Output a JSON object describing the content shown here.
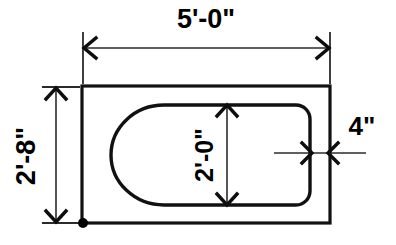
{
  "drawing": {
    "title": "Bathtub plan view with dimensions",
    "background_color": "#ffffff",
    "line_color": "#111111",
    "dimension_color": "#2b2b2b",
    "dimensions": {
      "overall_length": "5'-0\"",
      "overall_width": "2'-8\"",
      "tub_interior_width": "2'-0\"",
      "rim_width": "4\""
    },
    "labels": {
      "top_dimension": "5'-0\"",
      "left_dimension": "2'-8\"",
      "inner_dimension": "2'-0\"",
      "rim_dimension": "4\""
    },
    "geometry": {
      "outer_rect": {
        "x": 82,
        "y": 86,
        "width": 248,
        "height": 137
      },
      "tub_shape": {
        "x": 100,
        "y": 105,
        "width": 210,
        "height": 100,
        "corner_radius": 14,
        "left_end": "semicircular"
      },
      "top_dim_line_y": 48,
      "left_dim_line_x": 56,
      "inner_dim_line_x": 227,
      "rim_leader_y": 153,
      "origin_dot": {
        "x": 83,
        "y": 223
      }
    }
  }
}
